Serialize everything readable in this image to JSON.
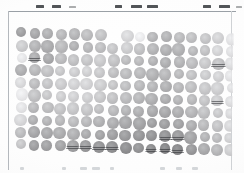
{
  "image": {
    "kind": "dot-blot-scan",
    "width": 244,
    "height": 173,
    "background_color": "#fdfdfd",
    "frame_color": "#9aa0a6",
    "caption": ""
  },
  "frame": {
    "top_y": 11,
    "left_x": 8,
    "right_x": 231,
    "bottom_y": 170
  },
  "top_ticks": [
    {
      "x": 36,
      "width": 8,
      "faint": false
    },
    {
      "x": 52,
      "width": 9,
      "faint": false
    },
    {
      "x": 69,
      "width": 7,
      "faint": true
    },
    {
      "x": 115,
      "width": 7,
      "faint": false
    },
    {
      "x": 131,
      "width": 11,
      "faint": false
    },
    {
      "x": 147,
      "width": 11,
      "faint": false
    },
    {
      "x": 203,
      "width": 8,
      "faint": false
    },
    {
      "x": 219,
      "width": 11,
      "faint": false
    },
    {
      "x": 236,
      "width": 6,
      "faint": true
    }
  ],
  "bottom_marks": [
    {
      "x": 20,
      "width": 4
    },
    {
      "x": 62,
      "width": 4
    },
    {
      "x": 80,
      "width": 7
    },
    {
      "x": 92,
      "width": 8
    },
    {
      "x": 110,
      "width": 4
    },
    {
      "x": 160,
      "width": 5
    },
    {
      "x": 176,
      "width": 6
    },
    {
      "x": 192,
      "width": 6
    }
  ],
  "grid": {
    "rows": 10,
    "cols": 17,
    "origin_x": 22,
    "origin_y": 33,
    "col_pitch": 13.1,
    "row_pitch": 12.4,
    "row_skew_x": -0.15,
    "col_skew_y": 0.38,
    "spot_diameter": 11.4,
    "note": "grayscale spot intensities, 0 = blank (no spot), 100 = darkest"
  },
  "chart_data": {
    "type": "heatmap",
    "title": "",
    "xlabel": "",
    "ylabel": "",
    "rows": 10,
    "cols": 17,
    "vmin": 0,
    "vmax": 100,
    "colormap": "grayscale-inverted",
    "values": [
      [
        62,
        58,
        52,
        47,
        49,
        44,
        40,
        8,
        26,
        12,
        48,
        50,
        45,
        42,
        38,
        30,
        18
      ],
      [
        34,
        50,
        54,
        46,
        52,
        47,
        43,
        38,
        33,
        40,
        49,
        52,
        50,
        46,
        40,
        28,
        20
      ],
      [
        16,
        55,
        57,
        44,
        41,
        38,
        35,
        40,
        44,
        46,
        50,
        53,
        49,
        44,
        36,
        42,
        22
      ],
      [
        52,
        47,
        41,
        36,
        33,
        31,
        36,
        42,
        45,
        47,
        51,
        48,
        46,
        41,
        34,
        30,
        19
      ],
      [
        24,
        44,
        39,
        34,
        30,
        29,
        33,
        39,
        43,
        46,
        49,
        52,
        47,
        43,
        37,
        32,
        21
      ],
      [
        14,
        41,
        37,
        33,
        31,
        32,
        36,
        41,
        45,
        48,
        52,
        54,
        50,
        46,
        39,
        34,
        23
      ],
      [
        18,
        46,
        43,
        39,
        37,
        38,
        42,
        46,
        50,
        53,
        56,
        58,
        54,
        49,
        42,
        36,
        25
      ],
      [
        26,
        52,
        50,
        46,
        45,
        47,
        51,
        55,
        58,
        60,
        63,
        64,
        60,
        54,
        46,
        40,
        27
      ],
      [
        44,
        58,
        57,
        54,
        53,
        56,
        60,
        63,
        66,
        68,
        70,
        72,
        68,
        60,
        50,
        44,
        30
      ],
      [
        38,
        64,
        62,
        60,
        62,
        66,
        70,
        72,
        74,
        71,
        76,
        80,
        78,
        68,
        56,
        48,
        32
      ]
    ],
    "streaked_cells": [
      [
        9,
        4
      ],
      [
        9,
        5
      ],
      [
        9,
        6
      ],
      [
        9,
        7
      ],
      [
        9,
        10
      ],
      [
        9,
        11
      ],
      [
        9,
        12
      ],
      [
        8,
        11
      ],
      [
        8,
        12
      ],
      [
        2,
        1
      ],
      [
        2,
        15
      ],
      [
        5,
        15
      ]
    ]
  }
}
